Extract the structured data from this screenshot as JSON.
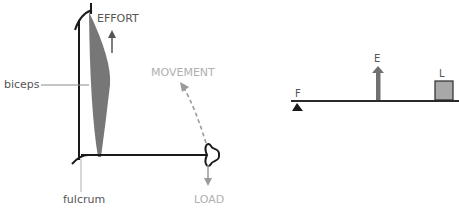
{
  "left_diagram": {
    "title": "Arm as a third-class lever",
    "labels": {
      "effort": "EFFORT",
      "biceps": "biceps",
      "movement": "MOVEMENT",
      "fulcrum": "fulcrum",
      "load": "LOAD"
    }
  },
  "right_diagram": {
    "title": "Lever schematic",
    "labels": {
      "fulcrum": "F",
      "effort": "E",
      "load": "L"
    }
  },
  "colors": {
    "line": "#1a1a1a",
    "muscle": "#777777",
    "label_dark": "#555555",
    "label_light": "#b0b0b0",
    "load_box": "#a8a8a8",
    "effort_arrow": "#707070"
  }
}
